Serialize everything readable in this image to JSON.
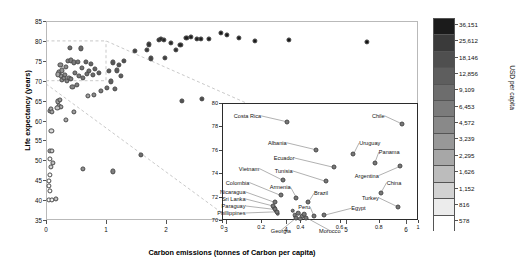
{
  "chart_data": {
    "type": "scatter",
    "title": "",
    "xlabel": "Carbon emissions (tonnes of Carbon per capita)",
    "ylabel": "Life expectancy (years)",
    "xlim": [
      0,
      6.2
    ],
    "ylim": [
      35,
      85
    ],
    "xticks": [
      0,
      1,
      2,
      3,
      4,
      5,
      6
    ],
    "yticks": [
      35,
      40,
      45,
      50,
      55,
      60,
      65,
      70,
      75,
      80,
      85
    ],
    "grid": false,
    "colorbar": {
      "label": "USD per capita",
      "ticks": [
        "36,151",
        "25,612",
        "18,146",
        "12,856",
        "9,109",
        "6,453",
        "4,572",
        "3,239",
        "2,295",
        "1,626",
        "1,152",
        "816",
        "578"
      ],
      "colors": [
        "#1b1b1b",
        "#3a3a3a",
        "#4f4f4f",
        "#5e5e5e",
        "#6d6d6d",
        "#7b7b7b",
        "#898989",
        "#989898",
        "#a7a7a7",
        "#bcbcbc",
        "#d2d2d2",
        "#ececec",
        "#ffffff"
      ]
    },
    "points": [
      {
        "x": 0.06,
        "y": 62.5,
        "c": "#9a9a9a"
      },
      {
        "x": 0.08,
        "y": 62.9,
        "c": "#a8a8a8"
      },
      {
        "x": 0.1,
        "y": 62.2,
        "c": "#a0a0a0"
      },
      {
        "x": 0.09,
        "y": 57.4,
        "c": "#d8d8d8"
      },
      {
        "x": 0.07,
        "y": 52.4,
        "c": "#b4b4b4"
      },
      {
        "x": 0.1,
        "y": 52.3,
        "c": "#c8c8c8"
      },
      {
        "x": 0.06,
        "y": 50.3,
        "c": "#fafafa"
      },
      {
        "x": 0.12,
        "y": 49.4,
        "c": "#bdbdbd"
      },
      {
        "x": 0.08,
        "y": 48.4,
        "c": "#d4d4d4"
      },
      {
        "x": 0.06,
        "y": 46.3,
        "c": "#fbfbfb"
      },
      {
        "x": 0.05,
        "y": 44.8,
        "c": "#fcfcfc"
      },
      {
        "x": 0.05,
        "y": 43.6,
        "c": "#fdfdfd"
      },
      {
        "x": 0.06,
        "y": 42.3,
        "c": "#fdfdfd"
      },
      {
        "x": 0.05,
        "y": 40.1,
        "c": "#fefefe"
      },
      {
        "x": 0.1,
        "y": 40.0,
        "c": "#f2f2f2"
      },
      {
        "x": 0.17,
        "y": 40.2,
        "c": "#bfbfbf"
      },
      {
        "x": 0.2,
        "y": 64.8,
        "c": "#9e9e9e"
      },
      {
        "x": 0.23,
        "y": 65.1,
        "c": "#9a9a9a"
      },
      {
        "x": 0.22,
        "y": 63.7,
        "c": "#b0b0b0"
      },
      {
        "x": 0.25,
        "y": 63.5,
        "c": "#a5a5a5"
      },
      {
        "x": 0.19,
        "y": 63.1,
        "c": "#c2c2c2"
      },
      {
        "x": 0.33,
        "y": 60.1,
        "c": "#ababab"
      },
      {
        "x": 0.47,
        "y": 62.2,
        "c": "#9d9d9d"
      },
      {
        "x": 0.62,
        "y": 47.9,
        "c": "#8e8e8e"
      },
      {
        "x": 1.12,
        "y": 47.2,
        "c": "#7e7e7e"
      },
      {
        "x": 1.58,
        "y": 51.3,
        "c": "#6e6e6e"
      },
      {
        "x": 0.27,
        "y": 70.3,
        "c": "#8f8f8f"
      },
      {
        "x": 0.3,
        "y": 70.6,
        "c": "#8a8a8a"
      },
      {
        "x": 0.25,
        "y": 71.2,
        "c": "#929292"
      },
      {
        "x": 0.31,
        "y": 71.4,
        "c": "#878787"
      },
      {
        "x": 0.22,
        "y": 72.1,
        "c": "#9c9c9c"
      },
      {
        "x": 0.27,
        "y": 72.6,
        "c": "#949494"
      },
      {
        "x": 0.2,
        "y": 71.6,
        "c": "#a6a6a6"
      },
      {
        "x": 0.35,
        "y": 69.9,
        "c": "#858585"
      },
      {
        "x": 0.38,
        "y": 70.8,
        "c": "#828282"
      },
      {
        "x": 0.42,
        "y": 70.4,
        "c": "#7f7f7f"
      },
      {
        "x": 0.24,
        "y": 74.0,
        "c": "#8d8d8d"
      },
      {
        "x": 0.33,
        "y": 73.4,
        "c": "#898989"
      },
      {
        "x": 0.36,
        "y": 74.9,
        "c": "#808080"
      },
      {
        "x": 0.42,
        "y": 75.1,
        "c": "#7c7c7c"
      },
      {
        "x": 0.47,
        "y": 74.6,
        "c": "#797979"
      },
      {
        "x": 0.4,
        "y": 78.2,
        "c": "#707070"
      },
      {
        "x": 0.58,
        "y": 78.1,
        "c": "#6b6b6b"
      },
      {
        "x": 0.53,
        "y": 74.8,
        "c": "#757575"
      },
      {
        "x": 0.6,
        "y": 73.2,
        "c": "#737373"
      },
      {
        "x": 0.48,
        "y": 71.9,
        "c": "#7a7a7a"
      },
      {
        "x": 0.55,
        "y": 71.2,
        "c": "#787878"
      },
      {
        "x": 0.62,
        "y": 70.6,
        "c": "#747474"
      },
      {
        "x": 0.52,
        "y": 68.9,
        "c": "#7d7d7d"
      },
      {
        "x": 0.44,
        "y": 68.5,
        "c": "#838383"
      },
      {
        "x": 0.68,
        "y": 71.8,
        "c": "#6f6f6f"
      },
      {
        "x": 0.72,
        "y": 72.4,
        "c": "#6c6c6c"
      },
      {
        "x": 0.78,
        "y": 71.5,
        "c": "#6a6a6a"
      },
      {
        "x": 0.66,
        "y": 74.8,
        "c": "#666666"
      },
      {
        "x": 0.75,
        "y": 74.2,
        "c": "#646464"
      },
      {
        "x": 0.82,
        "y": 73.0,
        "c": "#626262"
      },
      {
        "x": 0.88,
        "y": 71.9,
        "c": "#5f5f5f"
      },
      {
        "x": 0.7,
        "y": 66.2,
        "c": "#9f9f9f"
      },
      {
        "x": 0.8,
        "y": 66.5,
        "c": "#8b8b8b"
      },
      {
        "x": 0.92,
        "y": 67.5,
        "c": "#7b7b7b"
      },
      {
        "x": 1.05,
        "y": 72.4,
        "c": "#5b5b5b"
      },
      {
        "x": 1.12,
        "y": 74.6,
        "c": "#575757"
      },
      {
        "x": 1.22,
        "y": 73.9,
        "c": "#545454"
      },
      {
        "x": 1.3,
        "y": 74.9,
        "c": "#505050"
      },
      {
        "x": 1.18,
        "y": 72.6,
        "c": "#5a5a5a"
      },
      {
        "x": 1.25,
        "y": 71.2,
        "c": "#5d5d5d"
      },
      {
        "x": 1.08,
        "y": 69.8,
        "c": "#606060"
      },
      {
        "x": 1.15,
        "y": 67.9,
        "c": "#686868"
      },
      {
        "x": 1.02,
        "y": 68.1,
        "c": "#6d6d6d"
      },
      {
        "x": 1.48,
        "y": 77.5,
        "c": "#414141"
      },
      {
        "x": 1.68,
        "y": 77.8,
        "c": "#3b3b3b"
      },
      {
        "x": 1.75,
        "y": 75.6,
        "c": "#454545"
      },
      {
        "x": 1.72,
        "y": 79.1,
        "c": "#343434"
      },
      {
        "x": 1.88,
        "y": 80.2,
        "c": "#2b2b2b"
      },
      {
        "x": 1.92,
        "y": 80.4,
        "c": "#282828"
      },
      {
        "x": 1.96,
        "y": 80.3,
        "c": "#262626"
      },
      {
        "x": 2.08,
        "y": 79.5,
        "c": "#2a2a2a"
      },
      {
        "x": 2.16,
        "y": 77.7,
        "c": "#303030"
      },
      {
        "x": 2.24,
        "y": 79.0,
        "c": "#252525"
      },
      {
        "x": 2.34,
        "y": 80.7,
        "c": "#202020"
      },
      {
        "x": 2.42,
        "y": 81.0,
        "c": "#1e1e1e"
      },
      {
        "x": 2.52,
        "y": 80.4,
        "c": "#222222"
      },
      {
        "x": 2.58,
        "y": 80.6,
        "c": "#1f1f1f"
      },
      {
        "x": 2.72,
        "y": 80.5,
        "c": "#1d1d1d"
      },
      {
        "x": 2.92,
        "y": 82.0,
        "c": "#171717"
      },
      {
        "x": 3.02,
        "y": 81.6,
        "c": "#191919"
      },
      {
        "x": 3.22,
        "y": 80.8,
        "c": "#1c1c1c"
      },
      {
        "x": 3.48,
        "y": 79.9,
        "c": "#1b1b1b"
      },
      {
        "x": 4.05,
        "y": 80.2,
        "c": "#161616"
      },
      {
        "x": 5.35,
        "y": 79.8,
        "c": "#121212"
      },
      {
        "x": 2.26,
        "y": 65.0,
        "c": "#525252"
      },
      {
        "x": 2.6,
        "y": 65.4,
        "c": "#4c4c4c"
      },
      {
        "x": 1.98,
        "y": 75.7,
        "c": "#3f3f3f"
      }
    ],
    "inset": {
      "xlim": [
        0,
        1
      ],
      "ylim": [
        70,
        80
      ],
      "xticks": [
        0,
        0.2,
        0.4,
        0.6,
        0.8,
        1
      ],
      "xticklabels": [
        "0",
        "0.2",
        "0.4",
        "0.6",
        "0.8",
        "1"
      ],
      "yticks": [
        70,
        72,
        74,
        76,
        78,
        80
      ],
      "yticklabels": [
        "70",
        "72",
        "74",
        "76",
        "78",
        "80"
      ],
      "points": [
        {
          "label": "Costa Rica",
          "x": 0.33,
          "y": 78.4,
          "lx": 0.2,
          "ly": 78.9,
          "align": "r"
        },
        {
          "label": "Chile",
          "x": 0.92,
          "y": 78.2,
          "lx": 0.83,
          "ly": 78.9,
          "align": "r"
        },
        {
          "label": "Albania",
          "x": 0.48,
          "y": 76.0,
          "lx": 0.33,
          "ly": 76.6,
          "align": "r"
        },
        {
          "label": "Uruguay",
          "x": 0.67,
          "y": 75.6,
          "lx": 0.7,
          "ly": 76.6,
          "align": "l"
        },
        {
          "label": "Panama",
          "x": 0.78,
          "y": 74.9,
          "lx": 0.8,
          "ly": 75.8,
          "align": "l"
        },
        {
          "label": "Ecuador",
          "x": 0.57,
          "y": 74.5,
          "lx": 0.37,
          "ly": 75.3,
          "align": "r"
        },
        {
          "label": "Vietnam",
          "x": 0.31,
          "y": 73.4,
          "lx": 0.19,
          "ly": 74.4,
          "align": "r"
        },
        {
          "label": "Tunisia",
          "x": 0.53,
          "y": 73.3,
          "lx": 0.36,
          "ly": 74.2,
          "align": "r"
        },
        {
          "label": "Argentina",
          "x": 0.91,
          "y": 74.6,
          "lx": 0.8,
          "ly": 73.8,
          "align": "r"
        },
        {
          "label": "China",
          "x": 0.81,
          "y": 72.3,
          "lx": 0.84,
          "ly": 73.2,
          "align": "l"
        },
        {
          "label": "Colombia",
          "x": 0.3,
          "y": 72.1,
          "lx": 0.14,
          "ly": 73.2,
          "align": "r"
        },
        {
          "label": "Armenia",
          "x": 0.38,
          "y": 71.9,
          "lx": 0.35,
          "ly": 72.8,
          "align": "r"
        },
        {
          "label": "Brazil",
          "x": 0.44,
          "y": 71.5,
          "lx": 0.47,
          "ly": 72.3,
          "align": "l"
        },
        {
          "label": "Turkey",
          "x": 0.9,
          "y": 71.1,
          "lx": 0.8,
          "ly": 71.9,
          "align": "r"
        },
        {
          "label": "Nicaragua",
          "x": 0.27,
          "y": 71.5,
          "lx": 0.12,
          "ly": 72.4,
          "align": "r"
        },
        {
          "label": "Sri Lanka",
          "x": 0.26,
          "y": 71.2,
          "lx": 0.12,
          "ly": 71.8,
          "align": "r"
        },
        {
          "label": "Paraguay",
          "x": 0.27,
          "y": 70.9,
          "lx": 0.12,
          "ly": 71.2,
          "align": "r"
        },
        {
          "label": "Phillippines",
          "x": 0.28,
          "y": 70.7,
          "lx": 0.12,
          "ly": 70.6,
          "align": "r"
        },
        {
          "label": "Peru",
          "x": 0.47,
          "y": 70.3,
          "lx": 0.45,
          "ly": 71.1,
          "align": "r"
        },
        {
          "label": "Egypt",
          "x": 0.52,
          "y": 70.4,
          "lx": 0.66,
          "ly": 71.0,
          "align": "l"
        },
        {
          "label": "Georgia",
          "x": 0.38,
          "y": 70.2,
          "lx": 0.3,
          "ly": 69.1,
          "align": "c"
        },
        {
          "label": "Morocco",
          "x": 0.43,
          "y": 70.2,
          "lx": 0.55,
          "ly": 69.1,
          "align": "c"
        }
      ],
      "extra_points": [
        {
          "x": 0.37,
          "y": 70.4
        },
        {
          "x": 0.39,
          "y": 70.6
        },
        {
          "x": 0.41,
          "y": 70.3
        },
        {
          "x": 0.4,
          "y": 70.1
        },
        {
          "x": 0.36,
          "y": 70.8
        },
        {
          "x": 0.42,
          "y": 70.5
        },
        {
          "x": 0.265,
          "y": 71.05
        },
        {
          "x": 0.275,
          "y": 70.8
        },
        {
          "x": 0.285,
          "y": 70.55
        }
      ]
    }
  }
}
